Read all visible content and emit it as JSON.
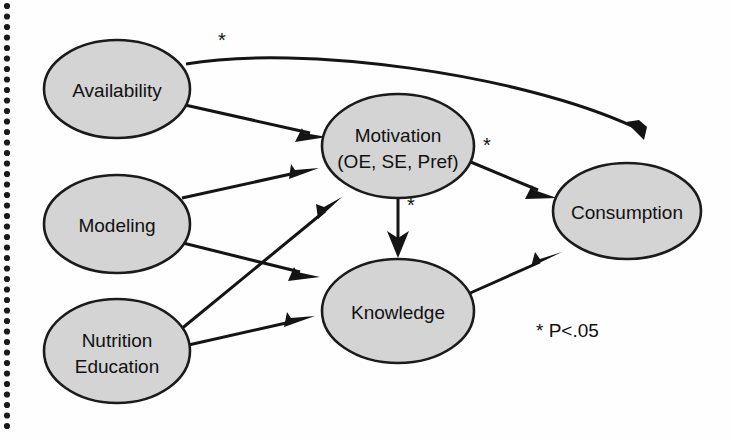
{
  "figure": {
    "type": "path-diagram",
    "background_color": "#fefefe",
    "node_fill_color": "#d4d4d4",
    "node_stroke_color": "#1b1b1b",
    "edge_color": "#141414"
  },
  "nodes": [
    {
      "id": "availability",
      "label": "Availability",
      "label_line2": "",
      "cx": 117,
      "cy": 89,
      "rx": 73,
      "ry": 49
    },
    {
      "id": "modeling",
      "label": "Modeling",
      "label_line2": "",
      "cx": 117,
      "cy": 224,
      "rx": 73,
      "ry": 49
    },
    {
      "id": "nutrition_education",
      "label": "Nutrition",
      "label_line2": "Education",
      "cx": 117,
      "cy": 351,
      "rx": 73,
      "ry": 52
    },
    {
      "id": "motivation",
      "label": "Motivation",
      "label_line2": "(OE, SE, Pref)",
      "cx": 398,
      "cy": 146,
      "rx": 76,
      "ry": 52
    },
    {
      "id": "knowledge",
      "label": "Knowledge",
      "label_line2": "",
      "cx": 398,
      "cy": 311,
      "rx": 76,
      "ry": 52
    },
    {
      "id": "consumption",
      "label": "Consumption",
      "label_line2": "",
      "cx": 627,
      "cy": 211,
      "rx": 74,
      "ry": 48
    }
  ],
  "edges": [
    {
      "id": "availability-to-consumption",
      "from": "availability",
      "to": "consumption",
      "significant": true,
      "star_x": 222,
      "star_y": 47
    },
    {
      "id": "availability-to-motivation",
      "from": "availability",
      "to": "motivation",
      "significant": false
    },
    {
      "id": "modeling-to-motivation",
      "from": "modeling",
      "to": "motivation",
      "significant": false
    },
    {
      "id": "modeling-to-knowledge",
      "from": "modeling",
      "to": "knowledge",
      "significant": false
    },
    {
      "id": "nutrition-education-to-motivation",
      "from": "nutrition_education",
      "to": "motivation",
      "significant": false
    },
    {
      "id": "nutrition-education-to-knowledge",
      "from": "nutrition_education",
      "to": "knowledge",
      "significant": false
    },
    {
      "id": "motivation-to-consumption",
      "from": "motivation",
      "to": "consumption",
      "significant": true,
      "star_x": 487,
      "star_y": 152
    },
    {
      "id": "motivation-to-knowledge",
      "from": "motivation",
      "to": "knowledge",
      "significant": true,
      "star_x": 411,
      "star_y": 212
    },
    {
      "id": "knowledge-to-consumption",
      "from": "knowledge",
      "to": "consumption",
      "significant": false
    }
  ],
  "markers": {
    "asterisk": "*",
    "star_top": "*",
    "star_motivation_consumption": "*",
    "star_motivation_knowledge": "*"
  },
  "legend": {
    "symbol": "*",
    "text": "P<.05",
    "full": "* P<.05",
    "x": 536,
    "y": 337
  },
  "page_edge": {
    "type": "dotted-scan-margin",
    "x": 7,
    "y_start": 6,
    "y_end": 426,
    "dot_spacing": 10.5,
    "dot_radius": 3.1,
    "color": "#1a1a1a"
  }
}
